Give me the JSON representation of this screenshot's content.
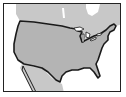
{
  "map": {
    "subject": "Contiguous United States outline map",
    "colors": {
      "land": "#c8c8c8",
      "us_fill": "#b4b4b4",
      "water": "#ffffff",
      "border": "#1a1a1a"
    }
  }
}
